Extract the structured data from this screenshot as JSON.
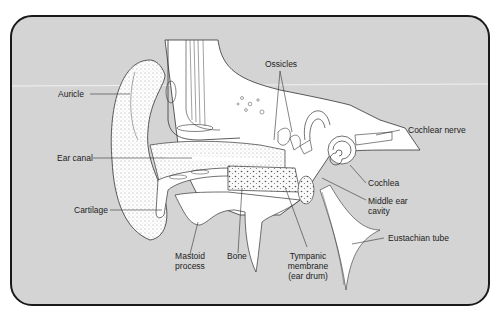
{
  "diagram": {
    "colors": {
      "background": "#d4d4d4",
      "border": "#1a1a1a",
      "tissue": "#ffffff",
      "line": "#333333"
    },
    "labels": {
      "auricle": "Auricle",
      "ear_canal": "Ear canal",
      "cartilage": "Cartilage",
      "mastoid_1": "Mastoid",
      "mastoid_2": "process",
      "bone": "Bone",
      "tympanic_1": "Tympanic",
      "tympanic_2": "membrane",
      "tympanic_3": "(ear drum)",
      "ossicles": "Ossicles",
      "cochlear_nerve": "Cochlear nerve",
      "cochlea": "Cochlea",
      "middle_ear_1": "Middle ear",
      "middle_ear_2": "cavity",
      "eustachian_tube": "Eustachian tube"
    }
  }
}
